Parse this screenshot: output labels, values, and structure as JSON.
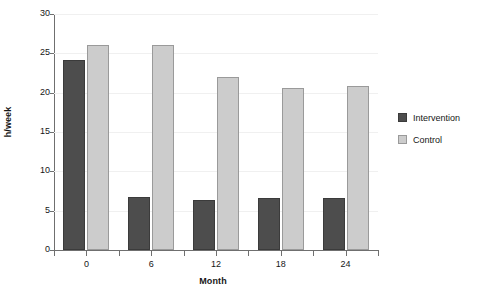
{
  "chart_data": {
    "type": "bar",
    "title": "",
    "xlabel": "Month",
    "ylabel": "h/week",
    "categories": [
      "0",
      "6",
      "12",
      "18",
      "24"
    ],
    "series": [
      {
        "name": "Intervention",
        "color": "#4d4d4d",
        "values": [
          24.2,
          6.7,
          6.3,
          6.6,
          6.6
        ]
      },
      {
        "name": "Control",
        "color": "#cccccc",
        "values": [
          26.1,
          26.1,
          22.0,
          20.6,
          20.9
        ]
      }
    ],
    "ylim": [
      0,
      30
    ],
    "yticks": [
      "0",
      "5",
      "10",
      "15",
      "20",
      "25",
      "30"
    ],
    "ytick_values": [
      0,
      5,
      10,
      15,
      20,
      25,
      30
    ],
    "grid": true,
    "legend_position": "right"
  },
  "legend": {
    "entries": [
      {
        "label": "Intervention"
      },
      {
        "label": "Control"
      }
    ]
  }
}
